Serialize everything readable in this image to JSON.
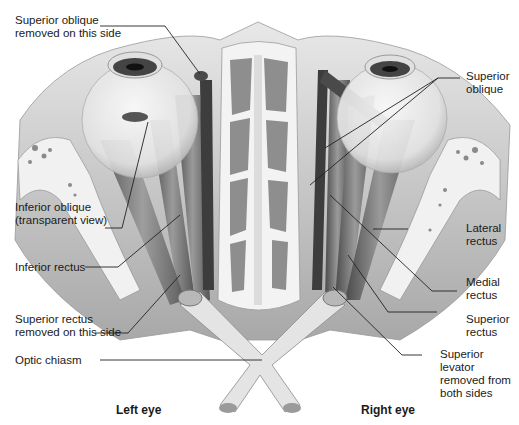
{
  "figure": {
    "colors": {
      "background": "#ffffff",
      "bone": "#ececec",
      "muscle_dark": "#5a5a5a",
      "muscle_mid": "#8a8a8a",
      "leader": "#222222",
      "text": "#1a1a1a"
    }
  },
  "labels": {
    "superior_oblique_removed": {
      "line1": "Superior oblique",
      "line2": "removed on this side"
    },
    "superior_oblique": {
      "line1": "Superior",
      "line2": "oblique"
    },
    "inferior_oblique": {
      "line1": "Inferior oblique",
      "line2": "(transparent view)"
    },
    "inferior_rectus": {
      "line1": "Inferior rectus"
    },
    "lateral_rectus": {
      "line1": "Lateral",
      "line2": "rectus"
    },
    "medial_rectus": {
      "line1": "Medial",
      "line2": "rectus"
    },
    "superior_rectus_removed": {
      "line1": "Superior rectus",
      "line2": "removed on this side"
    },
    "superior_rectus": {
      "line1": "Superior",
      "line2": "rectus"
    },
    "optic_chiasm": {
      "line1": "Optic chiasm"
    },
    "superior_levator": {
      "line1": "Superior",
      "line2": "levator",
      "line3": "removed from",
      "line4": "both sides"
    }
  },
  "captions": {
    "left": "Left eye",
    "right": "Right eye"
  }
}
